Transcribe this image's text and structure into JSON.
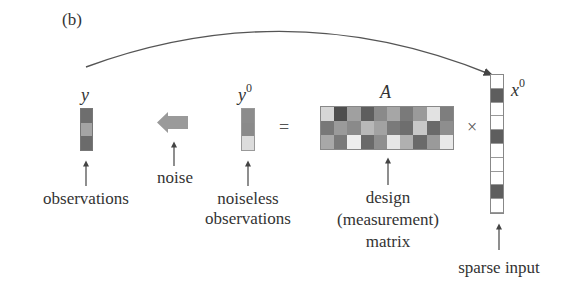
{
  "panel_label": "(b)",
  "symbols": {
    "y": "y",
    "y0_base": "y",
    "y0_sup": "0",
    "A": "A",
    "x0_base": "x",
    "x0_sup": "0",
    "equals": "=",
    "times": "×"
  },
  "labels": {
    "observations": "observations",
    "noise": "noise",
    "noiseless_line1": "noiseless",
    "noiseless_line2": "observations",
    "design_line1": "design",
    "design_line2": "(measurement)",
    "design_line3": "matrix",
    "sparse_input": "sparse input"
  },
  "vectors": {
    "y": [
      "#6e6e6e",
      "#a4a4a4",
      "#6b6b6b"
    ],
    "y0": [
      "#8c8c8c",
      "#8a8a8a",
      "#dcdcdc"
    ],
    "x0": [
      "#ffffff",
      "#5e5e5e",
      "#ffffff",
      "#ffffff",
      "#5e5e5e",
      "#ffffff",
      "#ffffff",
      "#ffffff",
      "#5e5e5e",
      "#ffffff"
    ]
  },
  "matrix_A": {
    "rows": 3,
    "cols": 10,
    "cells": [
      [
        "#d6d6d6",
        "#4e4e4e",
        "#a0a0a0",
        "#5e5e5e",
        "#8a8a8a",
        "#a6a6a6",
        "#7a7a7a",
        "#9a9a9a",
        "#e2e2e2",
        "#7e7e7e"
      ],
      [
        "#787878",
        "#9a9a9a",
        "#8a8a8a",
        "#b8b8b8",
        "#a2a2a2",
        "#7a7a7a",
        "#6e6e6e",
        "#c8c8c8",
        "#6a6a6a",
        "#8e8e8e"
      ],
      [
        "#a8a8a8",
        "#7a7a7a",
        "#eeeeee",
        "#6a6a6a",
        "#8e8e8e",
        "#e6e6e6",
        "#b0b0b0",
        "#6a6a6a",
        "#9a9a9a",
        "#e8e8e8"
      ]
    ]
  },
  "colors": {
    "line": "#555555",
    "noise_arrow": "#9a9a9a"
  }
}
